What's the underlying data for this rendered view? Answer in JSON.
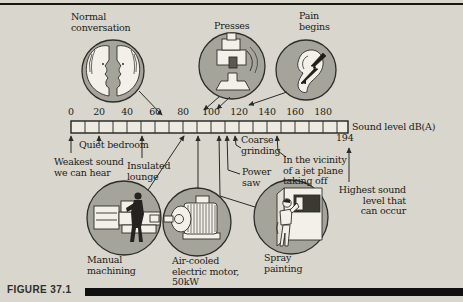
{
  "figure": {
    "caption": "FIGURE 37.1"
  },
  "colors": {
    "background": "#d8d6cd",
    "circle_fill": "#a5a49b",
    "icon_fill": "#f2f0e8",
    "ink": "#1d1c18",
    "bar_fill": "#eceae1"
  },
  "scale": {
    "unit_label": "Sound level dB(A)",
    "max_marker": "194",
    "min": 0,
    "max": 198,
    "ticks": [
      "0",
      "20",
      "40",
      "60",
      "80",
      "100",
      "120",
      "140",
      "160",
      "180"
    ]
  },
  "labels": {
    "normal_conversation": [
      "Normal",
      "conversation"
    ],
    "presses": [
      "Presses"
    ],
    "pain_begins": [
      "Pain",
      "begins"
    ],
    "quiet_bedroom": [
      "Quiet bedroom"
    ],
    "weakest_sound": [
      "Weakest sound",
      "we can hear"
    ],
    "insulated_lounge": [
      "Insulated",
      "lounge"
    ],
    "coarse_grinding": [
      "Coarse",
      "grinding"
    ],
    "power_saw": [
      "Power",
      "saw"
    ],
    "jet_plane": [
      "In the vicinity",
      "of a jet plane",
      "taking off"
    ],
    "highest_sound": [
      "Highest sound",
      "level that",
      "can occur"
    ],
    "manual_machining": [
      "Manual",
      "machining"
    ],
    "electric_motor": [
      "Air-cooled",
      "electric motor,",
      "50kW"
    ],
    "spray_painting": [
      "Spray",
      "painting"
    ]
  },
  "markers": [
    {
      "label": "Weakest sound we can hear",
      "dB": 0
    },
    {
      "label": "Quiet bedroom",
      "dB": 20
    },
    {
      "label": "Insulated lounge",
      "dB": 50
    },
    {
      "label": "Normal conversation",
      "dB": 65
    },
    {
      "label": "Manual machining",
      "dB": 80
    },
    {
      "label": "Air-cooled electric motor, 50kW",
      "dB": 90
    },
    {
      "label": "Presses",
      "dB": "95-105"
    },
    {
      "label": "Spray painting",
      "dB": 105
    },
    {
      "label": "Power saw",
      "dB": 111
    },
    {
      "label": "Coarse grinding",
      "dB": 117
    },
    {
      "label": "Pain begins",
      "dB": 125
    },
    {
      "label": "In the vicinity of a jet plane taking off",
      "dB": 148
    },
    {
      "label": "Highest sound level that can occur",
      "dB": 194
    }
  ]
}
